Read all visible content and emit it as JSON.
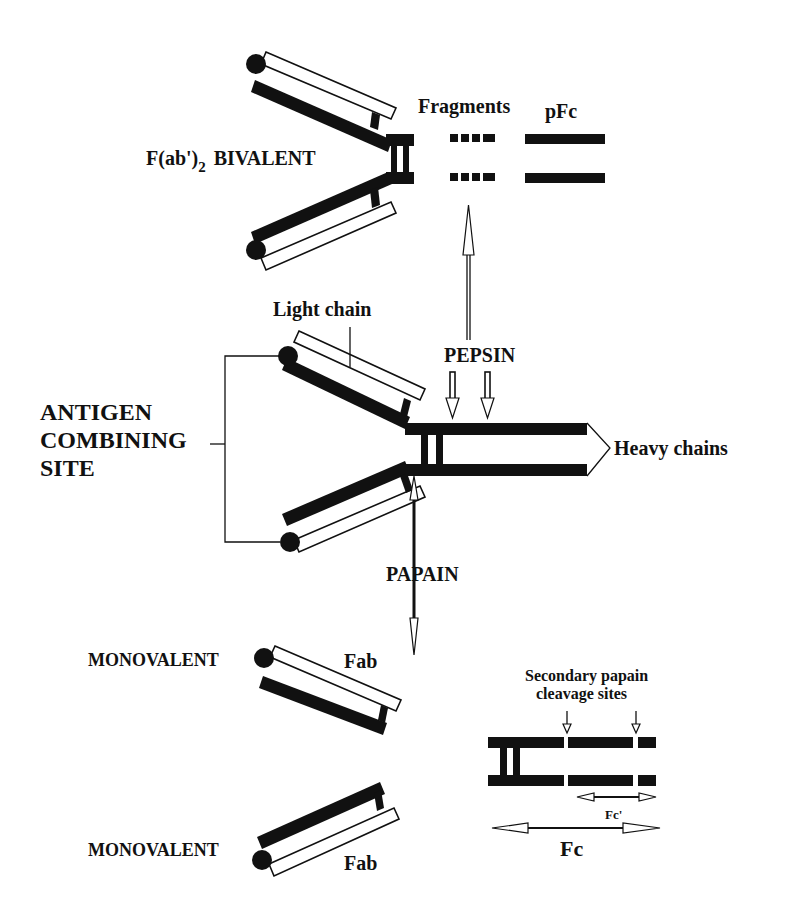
{
  "diagram": {
    "labels": {
      "fab2": "F(ab')",
      "fab2_sub": "2",
      "bivalent": "BIVALENT",
      "fragments": "Fragments",
      "pfc": "pFc",
      "light_chain": "Light chain",
      "pepsin": "PEPSIN",
      "antigen_line1": "ANTIGEN",
      "antigen_line2": "COMBINING",
      "antigen_line3": "SITE",
      "heavy_chains": "Heavy chains",
      "papain": "PAPAIN",
      "monovalent_top": "MONOVALENT",
      "fab_top": "Fab",
      "monovalent_bottom": "MONOVALENT",
      "fab_bottom": "Fab",
      "secondary_line1": "Secondary papain",
      "secondary_line2": "cleavage sites",
      "fc_prime": "Fc'",
      "fc": "Fc"
    },
    "colors": {
      "ink": "#111111",
      "background": "#ffffff"
    }
  }
}
